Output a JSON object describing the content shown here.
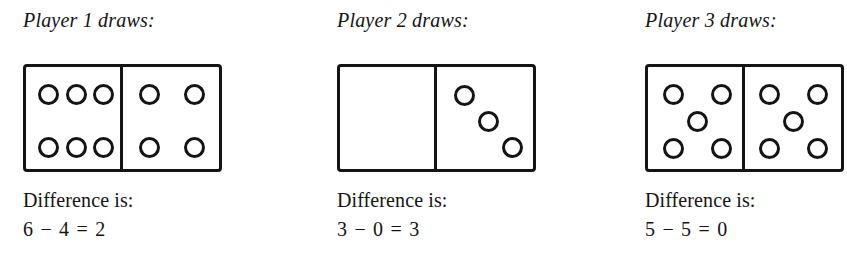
{
  "page": {
    "background_color": "#ffffff",
    "ink_color": "#141414"
  },
  "players": [
    {
      "heading": "Player 1 draws:",
      "domino": {
        "left_value": 6,
        "right_value": 4,
        "left_pips": [
          {
            "x": 22,
            "y": 27
          },
          {
            "x": 50,
            "y": 27
          },
          {
            "x": 77,
            "y": 27
          },
          {
            "x": 22,
            "y": 80
          },
          {
            "x": 50,
            "y": 80
          },
          {
            "x": 77,
            "y": 80
          }
        ],
        "right_pips": [
          {
            "x": 27,
            "y": 27
          },
          {
            "x": 72,
            "y": 27
          },
          {
            "x": 27,
            "y": 80
          },
          {
            "x": 72,
            "y": 80
          }
        ]
      },
      "difference_label": "Difference is:",
      "equation": "6 − 4 = 2",
      "minuend": 6,
      "subtrahend": 4,
      "difference": 2
    },
    {
      "heading": "Player 2 draws:",
      "domino": {
        "left_value": 0,
        "right_value": 3,
        "left_pips": [],
        "right_pips": [
          {
            "x": 28,
            "y": 28
          },
          {
            "x": 52,
            "y": 54
          },
          {
            "x": 76,
            "y": 80
          }
        ]
      },
      "difference_label": "Difference is:",
      "equation": "3 − 0 = 3",
      "minuend": 3,
      "subtrahend": 0,
      "difference": 3
    },
    {
      "heading": "Player 3 draws:",
      "domino": {
        "left_value": 5,
        "right_value": 5,
        "left_pips": [
          {
            "x": 25,
            "y": 27
          },
          {
            "x": 73,
            "y": 27
          },
          {
            "x": 49,
            "y": 54
          },
          {
            "x": 25,
            "y": 81
          },
          {
            "x": 73,
            "y": 81
          }
        ],
        "right_pips": [
          {
            "x": 25,
            "y": 27
          },
          {
            "x": 73,
            "y": 27
          },
          {
            "x": 49,
            "y": 54
          },
          {
            "x": 25,
            "y": 81
          },
          {
            "x": 73,
            "y": 81
          }
        ]
      },
      "difference_label": "Difference is:",
      "equation": "5 − 5 = 0",
      "minuend": 5,
      "subtrahend": 5,
      "difference": 0
    }
  ]
}
